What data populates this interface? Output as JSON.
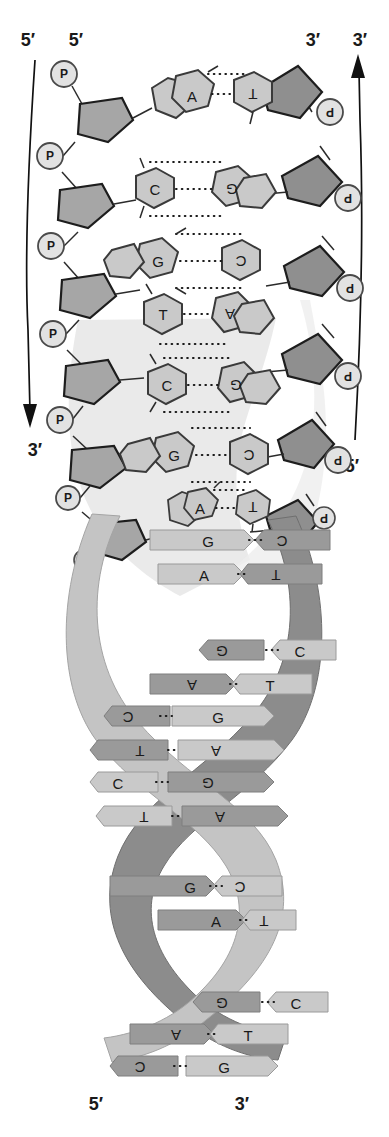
{
  "colors": {
    "base_fill": "#c9c9c9",
    "base_stroke": "#3a3a3a",
    "sugar_fill": "#a6a6a6",
    "sugar_stroke": "#1d1d1d",
    "phosphate_fill": "#e2e2e2",
    "phosphate_stroke": "#4a4a4a",
    "ribbon_front": "#c4c4c4",
    "ribbon_back": "#8c8c8c",
    "rung_light": "#c9c9c9",
    "rung_dark": "#9a9a9a",
    "halo": "#dcdcdc",
    "text": "#1a1a1a",
    "background": "#ffffff"
  },
  "labels": {
    "top_left_outer": "5′",
    "top_left_inner": "5′",
    "top_right_inner": "3′",
    "top_right_outer": "3′",
    "mid_left_arrow_end": "3′",
    "mid_right_arrow_start": "5′",
    "bottom_left": "5′",
    "bottom_right": "3′"
  },
  "arrows": {
    "left": {
      "name": "left-strand-direction-arrow",
      "start_label": "5′",
      "end_label": "3′",
      "direction": "down"
    },
    "right": {
      "name": "right-strand-direction-arrow",
      "start_label": "5′",
      "end_label": "3′",
      "direction": "up"
    }
  },
  "backbone": {
    "phosphate_symbol": "P",
    "left_phosphate_count": 7,
    "right_phosphate_count": 7,
    "left_phosphate_labels": [
      "P",
      "P",
      "P",
      "P",
      "P",
      "P",
      "P"
    ],
    "right_phosphate_labels": [
      "P",
      "P",
      "P",
      "P",
      "P",
      "P",
      "P"
    ],
    "sugar_shape": "pentagon",
    "sugar_name": "deoxyribose"
  },
  "ladder_rungs": [
    {
      "left": "A",
      "right": "T",
      "bonds": 2,
      "left_type": "purine",
      "right_type": "pyrimidine"
    },
    {
      "left": "C",
      "right": "G",
      "bonds": 3,
      "left_type": "pyrimidine",
      "right_type": "purine"
    },
    {
      "left": "G",
      "right": "C",
      "bonds": 3,
      "left_type": "purine",
      "right_type": "pyrimidine"
    },
    {
      "left": "T",
      "right": "A",
      "bonds": 2,
      "left_type": "pyrimidine",
      "right_type": "purine"
    },
    {
      "left": "C",
      "right": "G",
      "bonds": 3,
      "left_type": "pyrimidine",
      "right_type": "purine"
    },
    {
      "left": "G",
      "right": "C",
      "bonds": 3,
      "left_type": "purine",
      "right_type": "pyrimidine"
    },
    {
      "left": "A",
      "right": "T",
      "bonds": 2,
      "left_type": "purine",
      "right_type": "pyrimidine"
    }
  ],
  "helix_rungs": [
    {
      "left": "G",
      "right": "C",
      "face": "front"
    },
    {
      "left": "A",
      "right": "T",
      "face": "front"
    },
    {
      "left": "G",
      "right": "C",
      "face": "back"
    },
    {
      "left": "A",
      "right": "T",
      "face": "back"
    },
    {
      "left": "C",
      "right": "G",
      "face": "back"
    },
    {
      "left": "T",
      "right": "A",
      "face": "back"
    },
    {
      "left": "C",
      "right": "G",
      "face": "front"
    },
    {
      "left": "T",
      "right": "A",
      "face": "front"
    },
    {
      "left": "G",
      "right": "C",
      "face": "front"
    },
    {
      "left": "A",
      "right": "T",
      "face": "front"
    },
    {
      "left": "G",
      "right": "C",
      "face": "back"
    },
    {
      "left": "A",
      "right": "T",
      "face": "back"
    },
    {
      "left": "C",
      "right": "G",
      "face": "back"
    }
  ],
  "hydrogen_bond_symbol": "···"
}
